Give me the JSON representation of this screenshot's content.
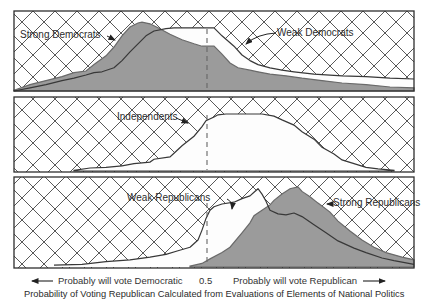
{
  "figure": {
    "caption": "Probability of Voting Republican Calculated from Evaluations of Elements of National Politics",
    "axis": {
      "left_label": "Probably will vote Democratic",
      "midpoint_label": "0.5",
      "right_label": "Probably will vote Republican"
    },
    "panel_labels": {
      "strong_democrats": "Strong Democrats",
      "weak_democrats": "Weak Democrats",
      "independents": "Independents",
      "weak_republicans": "Weak Republicans",
      "strong_republicans": "Strong Republicans"
    },
    "colors": {
      "shaded_fill": "#9b9b9b",
      "shaded_stroke": "#6a6a6a",
      "curve_outline": "#383838",
      "hatch_line": "#464646",
      "dashed_line": "#666666"
    }
  },
  "chart_data": {
    "type": "area",
    "title": "Probability of Voting Republican Calculated from Evaluations of Elements of National Politics",
    "xlabel_left": "Probably will vote Democratic",
    "xlabel_right": "Probably will vote Republican",
    "x_reference": 0.5,
    "x_range": [
      0,
      1
    ],
    "y_axis": "relative frequency (unlabeled density, 0-1 of panel height)",
    "grid": "crosshatch background outside distributions",
    "legend_position": "in-panel labels with arrows",
    "panels": [
      {
        "groups": [
          "Strong Democrats",
          "Weak Democrats"
        ]
      },
      {
        "groups": [
          "Independents"
        ]
      },
      {
        "groups": [
          "Weak Republicans",
          "Strong Republicans"
        ]
      }
    ],
    "series": [
      {
        "name": "Strong Democrats",
        "key": "strong_democrats",
        "shaded": true,
        "points": [
          [
            0.0,
            0.01
          ],
          [
            0.04,
            0.08
          ],
          [
            0.08,
            0.13
          ],
          [
            0.12,
            0.18
          ],
          [
            0.15,
            0.23
          ],
          [
            0.18,
            0.25
          ],
          [
            0.2,
            0.33
          ],
          [
            0.23,
            0.44
          ],
          [
            0.25,
            0.55
          ],
          [
            0.27,
            0.69
          ],
          [
            0.29,
            0.8
          ],
          [
            0.31,
            0.85
          ],
          [
            0.32,
            0.86
          ],
          [
            0.34,
            0.84
          ],
          [
            0.36,
            0.79
          ],
          [
            0.39,
            0.71
          ],
          [
            0.42,
            0.64
          ],
          [
            0.45,
            0.59
          ],
          [
            0.47,
            0.56
          ],
          [
            0.5,
            0.56
          ],
          [
            0.52,
            0.46
          ],
          [
            0.54,
            0.35
          ],
          [
            0.56,
            0.29
          ],
          [
            0.59,
            0.26
          ],
          [
            0.61,
            0.24
          ],
          [
            0.64,
            0.21
          ],
          [
            0.68,
            0.19
          ],
          [
            0.72,
            0.16
          ],
          [
            0.77,
            0.13
          ],
          [
            0.82,
            0.1
          ],
          [
            0.88,
            0.08
          ],
          [
            0.94,
            0.05
          ],
          [
            1.0,
            0.04
          ]
        ]
      },
      {
        "name": "Weak Democrats",
        "key": "weak_democrats",
        "shaded": false,
        "points": [
          [
            0.0,
            0.0
          ],
          [
            0.04,
            0.04
          ],
          [
            0.08,
            0.08
          ],
          [
            0.12,
            0.13
          ],
          [
            0.15,
            0.16
          ],
          [
            0.18,
            0.2
          ],
          [
            0.2,
            0.23
          ],
          [
            0.22,
            0.24
          ],
          [
            0.25,
            0.29
          ],
          [
            0.27,
            0.38
          ],
          [
            0.29,
            0.49
          ],
          [
            0.31,
            0.59
          ],
          [
            0.33,
            0.69
          ],
          [
            0.35,
            0.75
          ],
          [
            0.38,
            0.78
          ],
          [
            0.4,
            0.79
          ],
          [
            0.5,
            0.79
          ],
          [
            0.52,
            0.69
          ],
          [
            0.55,
            0.56
          ],
          [
            0.57,
            0.45
          ],
          [
            0.59,
            0.38
          ],
          [
            0.61,
            0.33
          ],
          [
            0.64,
            0.29
          ],
          [
            0.67,
            0.26
          ],
          [
            0.7,
            0.24
          ],
          [
            0.75,
            0.21
          ],
          [
            0.82,
            0.19
          ],
          [
            0.88,
            0.18
          ],
          [
            0.94,
            0.16
          ],
          [
            1.0,
            0.15
          ]
        ]
      },
      {
        "name": "Independents",
        "key": "independents",
        "shaded": false,
        "points": [
          [
            0.15,
            0.01
          ],
          [
            0.19,
            0.04
          ],
          [
            0.23,
            0.05
          ],
          [
            0.27,
            0.07
          ],
          [
            0.3,
            0.1
          ],
          [
            0.34,
            0.12
          ],
          [
            0.35,
            0.16
          ],
          [
            0.39,
            0.19
          ],
          [
            0.4,
            0.24
          ],
          [
            0.42,
            0.34
          ],
          [
            0.45,
            0.47
          ],
          [
            0.47,
            0.6
          ],
          [
            0.48,
            0.68
          ],
          [
            0.5,
            0.73
          ],
          [
            0.51,
            0.76
          ],
          [
            0.53,
            0.77
          ],
          [
            0.62,
            0.77
          ],
          [
            0.65,
            0.74
          ],
          [
            0.67,
            0.69
          ],
          [
            0.7,
            0.62
          ],
          [
            0.72,
            0.53
          ],
          [
            0.75,
            0.43
          ],
          [
            0.77,
            0.32
          ],
          [
            0.8,
            0.23
          ],
          [
            0.82,
            0.15
          ],
          [
            0.85,
            0.1
          ],
          [
            0.88,
            0.05
          ],
          [
            0.91,
            0.03
          ],
          [
            0.95,
            0.01
          ]
        ]
      },
      {
        "name": "Weak Republicans",
        "key": "weak_republicans",
        "shaded": false,
        "points": [
          [
            0.1,
            0.02
          ],
          [
            0.17,
            0.03
          ],
          [
            0.23,
            0.06
          ],
          [
            0.29,
            0.08
          ],
          [
            0.34,
            0.11
          ],
          [
            0.38,
            0.14
          ],
          [
            0.41,
            0.18
          ],
          [
            0.44,
            0.22
          ],
          [
            0.46,
            0.3
          ],
          [
            0.47,
            0.41
          ],
          [
            0.48,
            0.54
          ],
          [
            0.49,
            0.63
          ],
          [
            0.5,
            0.67
          ],
          [
            0.52,
            0.7
          ],
          [
            0.55,
            0.72
          ],
          [
            0.57,
            0.76
          ],
          [
            0.59,
            0.79
          ],
          [
            0.6,
            0.83
          ],
          [
            0.61,
            0.87
          ],
          [
            0.62,
            0.81
          ],
          [
            0.63,
            0.73
          ],
          [
            0.64,
            0.63
          ],
          [
            0.66,
            0.59
          ],
          [
            0.68,
            0.58
          ],
          [
            0.7,
            0.6
          ],
          [
            0.72,
            0.56
          ],
          [
            0.75,
            0.47
          ],
          [
            0.78,
            0.38
          ],
          [
            0.81,
            0.29
          ],
          [
            0.85,
            0.21
          ],
          [
            0.88,
            0.16
          ],
          [
            0.92,
            0.1
          ],
          [
            0.95,
            0.07
          ],
          [
            1.0,
            0.03
          ]
        ]
      },
      {
        "name": "Strong Republicans",
        "key": "strong_republicans",
        "shaded": true,
        "points": [
          [
            0.44,
            0.01
          ],
          [
            0.47,
            0.04
          ],
          [
            0.49,
            0.09
          ],
          [
            0.52,
            0.16
          ],
          [
            0.54,
            0.22
          ],
          [
            0.57,
            0.38
          ],
          [
            0.59,
            0.49
          ],
          [
            0.6,
            0.57
          ],
          [
            0.62,
            0.63
          ],
          [
            0.64,
            0.69
          ],
          [
            0.65,
            0.74
          ],
          [
            0.67,
            0.81
          ],
          [
            0.69,
            0.87
          ],
          [
            0.71,
            0.89
          ],
          [
            0.72,
            0.84
          ],
          [
            0.74,
            0.78
          ],
          [
            0.76,
            0.71
          ],
          [
            0.79,
            0.61
          ],
          [
            0.81,
            0.51
          ],
          [
            0.84,
            0.4
          ],
          [
            0.87,
            0.3
          ],
          [
            0.9,
            0.22
          ],
          [
            0.93,
            0.16
          ],
          [
            0.97,
            0.11
          ],
          [
            1.0,
            0.08
          ]
        ]
      }
    ]
  }
}
